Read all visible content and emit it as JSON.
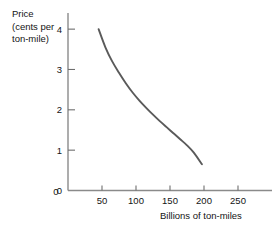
{
  "chart_data": {
    "type": "line",
    "title": "",
    "subtitle": "",
    "ylabel_lines": [
      "Price",
      "(cents per",
      "ton-mile)"
    ],
    "ylabel": "Price (cents per ton-mile)",
    "xlabel": "Billions of ton-miles",
    "xlim": [
      0,
      300
    ],
    "ylim": [
      0,
      4.4
    ],
    "grid": false,
    "legend": null,
    "legend_position": "none",
    "xticks": [
      0,
      50,
      100,
      150,
      200,
      250
    ],
    "xtick_labels": [
      "0",
      "50",
      "100",
      "150",
      "200",
      "250"
    ],
    "yticks": [
      0,
      1,
      2,
      3,
      4
    ],
    "ytick_labels": [
      "0",
      "1",
      "2",
      "3",
      "4"
    ],
    "series": [
      {
        "name": "Demand curve",
        "color": "#5a5a5a",
        "x": [
          45,
          55,
          65,
          75,
          85,
          95,
          105,
          115,
          125,
          135,
          145,
          155,
          165,
          175,
          185,
          197
        ],
        "y": [
          4.0,
          3.55,
          3.2,
          2.92,
          2.66,
          2.43,
          2.23,
          2.05,
          1.88,
          1.72,
          1.57,
          1.42,
          1.27,
          1.12,
          0.94,
          0.65
        ]
      }
    ],
    "annotations": []
  },
  "colors": {
    "background": "#ffffff",
    "axis": "#8a8a8a",
    "tick": "#6e6e6e",
    "text": "#141414",
    "curve": "#5a5a5a"
  }
}
